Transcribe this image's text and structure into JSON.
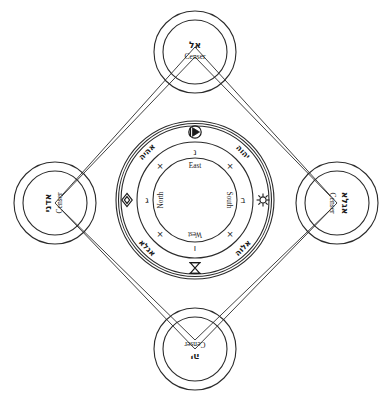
{
  "figure": {
    "caption_partial": ""
  },
  "center": {
    "directions": [
      {
        "name": "east-label",
        "text": "East"
      },
      {
        "name": "south-label",
        "text": "South"
      },
      {
        "name": "west-label",
        "text": "West"
      },
      {
        "name": "north-label",
        "text": "North"
      }
    ],
    "divine_names": [
      {
        "name": "divine-name-upper-left",
        "text": "אהיה"
      },
      {
        "name": "divine-name-upper-right",
        "text": "יהוה"
      },
      {
        "name": "divine-name-lower-right",
        "text": "אלוה"
      },
      {
        "name": "divine-name-lower-left",
        "text": "אגלא"
      }
    ],
    "cardinal_sigils": [
      {
        "name": "sigil-top",
        "text": "נ"
      },
      {
        "name": "sigil-right",
        "text": "ב"
      },
      {
        "name": "sigil-bottom",
        "text": "ו"
      },
      {
        "name": "sigil-left",
        "text": "ג"
      }
    ],
    "crosses": [
      {
        "name": "cross-mark-ne",
        "text": "×"
      },
      {
        "name": "cross-mark-se",
        "text": "×"
      },
      {
        "name": "cross-mark-sw",
        "text": "×"
      },
      {
        "name": "cross-mark-nw",
        "text": "×"
      }
    ],
    "outer_symbols": [
      {
        "name": "symbol-east-triangle-in-circle",
        "position": "top"
      },
      {
        "name": "symbol-south-sunburst",
        "position": "right"
      },
      {
        "name": "symbol-west-hourglass",
        "position": "bottom"
      },
      {
        "name": "symbol-north-rhombus",
        "position": "left"
      }
    ]
  },
  "censers": [
    {
      "name": "censer-top",
      "label": "Censer",
      "hebrew": "אל",
      "rotation": 0
    },
    {
      "name": "censer-right",
      "label": "Censer",
      "hebrew": "אגלא",
      "rotation": 90
    },
    {
      "name": "censer-bottom",
      "label": "Censer",
      "hebrew": "יה",
      "rotation": 180
    },
    {
      "name": "censer-left",
      "label": "Censer",
      "hebrew": "אדני",
      "rotation": 270
    }
  ],
  "colors": {
    "ink": "#1a1a1a",
    "stroke": "#2b2b2b",
    "background": "#ffffff"
  }
}
